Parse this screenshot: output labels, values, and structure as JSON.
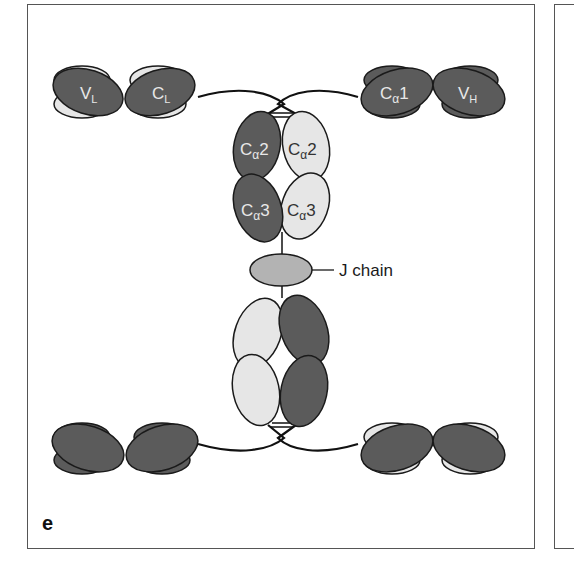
{
  "figure": {
    "panel_letter": "e",
    "colors": {
      "dark_domain": "#5b5b5b",
      "light_domain": "#e6e6e6",
      "j_chain": "#b3b3b3",
      "outline": "#1a1a1a",
      "frame": "#555555"
    },
    "labels": {
      "top_left": {
        "VL": "V",
        "VL_sub": "L",
        "CL": "C",
        "CL_sub": "L"
      },
      "top_right": {
        "Ca1": "C",
        "Ca1_sub": "α",
        "Ca1_num": "1",
        "VH": "V",
        "VH_sub": "H"
      },
      "stem": {
        "Ca2_left": "C",
        "Ca2_left_sub": "α",
        "Ca2_left_num": "2",
        "Ca2_right": "C",
        "Ca2_right_sub": "α",
        "Ca2_right_num": "2",
        "Ca3_left": "C",
        "Ca3_left_sub": "α",
        "Ca3_left_num": "3",
        "Ca3_right": "C",
        "Ca3_right_sub": "α",
        "Ca3_right_num": "3"
      },
      "j_chain": "J chain"
    }
  }
}
